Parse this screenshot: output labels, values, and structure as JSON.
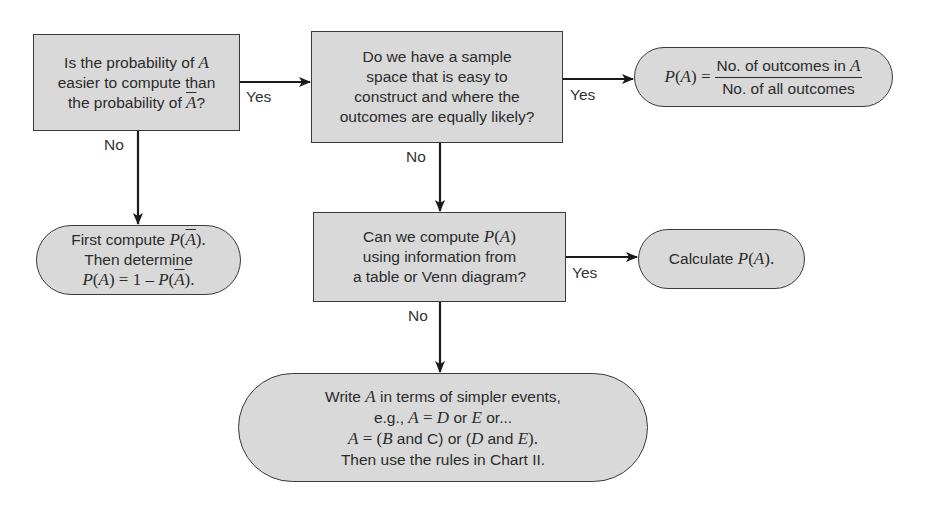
{
  "diagram": {
    "type": "flowchart",
    "colors": {
      "node_fill": "#d9d9d9",
      "node_border": "#3a3a3a",
      "text": "#2b2b2b",
      "edge": "#1a1a1a"
    },
    "nodes": {
      "q1": {
        "shape": "rectangle",
        "lines": [
          "Is the probability of A",
          "easier to compute than",
          "the probability of Ā?"
        ],
        "l1_pre": "Is the probability of ",
        "l1_var": "A",
        "l2": "easier to compute than",
        "l3_pre": "the probability of ",
        "l3_var": "A",
        "l3_post": "?"
      },
      "q2": {
        "shape": "rectangle",
        "lines": [
          "Do we have a sample",
          "space that is easy to",
          "construct and where the",
          "outcomes are equally likely?"
        ]
      },
      "t_formula": {
        "shape": "terminal",
        "lhs_p": "P",
        "lhs_open": "(",
        "lhs_var": "A",
        "lhs_close": ")",
        "eq": " =",
        "numerator_text": "No. of outcomes in ",
        "numerator_var": "A",
        "denominator": "No. of all outcomes"
      },
      "t_complement": {
        "shape": "terminal",
        "l1_pre": "First compute ",
        "l1_p": "P",
        "l1_open": "(",
        "l1_var": "A",
        "l1_close": ").",
        "l2": "Then determine",
        "l3_p1": "P",
        "l3_open1": "(",
        "l3_var1": "A",
        "l3_close1": ")",
        "l3_mid": " = 1 – ",
        "l3_p2": "P",
        "l3_open2": "(",
        "l3_var2": "A",
        "l3_close2": ")."
      },
      "q3": {
        "shape": "rectangle",
        "l1_pre": "Can we compute ",
        "l1_p": "P",
        "l1_open": "(",
        "l1_var": "A",
        "l1_close": ")",
        "l2": "using information from",
        "l3": "a table or Venn diagram?"
      },
      "t_calculate": {
        "shape": "terminal",
        "pre": "Calculate ",
        "p": "P",
        "open": "(",
        "var": "A",
        "close": ")."
      },
      "t_simpler": {
        "shape": "terminal",
        "l1_pre": "Write ",
        "l1_var": "A",
        "l1_post": " in terms of simpler events,",
        "l2_pre": "e.g., ",
        "l2_a": "A",
        "l2_eq": " = ",
        "l2_d": "D",
        "l2_or": " or ",
        "l2_e": "E",
        "l2_post": " or...",
        "l3_a": "A",
        "l3_eq": " = (",
        "l3_b": "B",
        "l3_and1": " and C) or (",
        "l3_d": "D",
        "l3_and2": " and ",
        "l3_e": "E",
        "l3_post": ").",
        "l4": "Then use the rules in Chart II."
      }
    },
    "edges": [
      {
        "from": "q1",
        "to": "q2",
        "label": "Yes"
      },
      {
        "from": "q1",
        "to": "t_complement",
        "label": "No"
      },
      {
        "from": "q2",
        "to": "t_formula",
        "label": "Yes"
      },
      {
        "from": "q2",
        "to": "q3",
        "label": "No"
      },
      {
        "from": "q3",
        "to": "t_calculate",
        "label": "Yes"
      },
      {
        "from": "q3",
        "to": "t_simpler",
        "label": "No"
      }
    ]
  }
}
